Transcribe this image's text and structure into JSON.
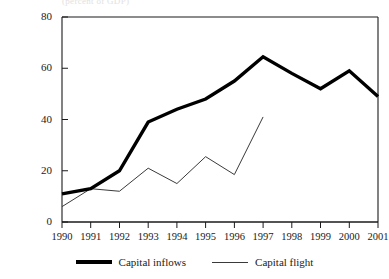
{
  "clipped_caption": "(percent of GDP)",
  "legend": {
    "position": "bottom-center",
    "items": [
      {
        "label": "Capital inflows",
        "style": "thick",
        "color": "#000000"
      },
      {
        "label": "Capital flight",
        "style": "thin",
        "color": "#3a3a3a"
      }
    ]
  },
  "axes": {
    "y_ticks": [
      "0",
      "20",
      "40",
      "60",
      "80"
    ],
    "x_ticks": [
      "1990",
      "1991",
      "1992",
      "1993",
      "1994",
      "1995",
      "1996",
      "1997",
      "1998",
      "1999",
      "2000",
      "2001"
    ]
  },
  "chart_data": {
    "type": "line",
    "title": "",
    "subtitle": "",
    "xlabel": "",
    "ylabel": "",
    "categories": [
      "1990",
      "1991",
      "1992",
      "1993",
      "1994",
      "1995",
      "1996",
      "1997",
      "1998",
      "1999",
      "2000",
      "2001"
    ],
    "x": [
      1990,
      1991,
      1992,
      1993,
      1994,
      1995,
      1996,
      1997,
      1998,
      1999,
      2000,
      2001
    ],
    "ylim": [
      0,
      80
    ],
    "xlim": [
      1990,
      2001
    ],
    "y_tick_values": [
      0,
      20,
      40,
      60,
      80
    ],
    "grid": false,
    "legend_position": "bottom-center",
    "series": [
      {
        "name": "Capital inflows",
        "color": "#000000",
        "line_width": 3.4,
        "values": [
          11,
          13,
          20,
          39,
          44,
          48,
          55,
          64.5,
          58,
          52,
          59,
          49
        ]
      },
      {
        "name": "Capital flight",
        "color": "#3a3a3a",
        "line_width": 1,
        "values": [
          6,
          13,
          12,
          21,
          15,
          25.5,
          18.5,
          41,
          null,
          null,
          null,
          null
        ]
      }
    ]
  }
}
